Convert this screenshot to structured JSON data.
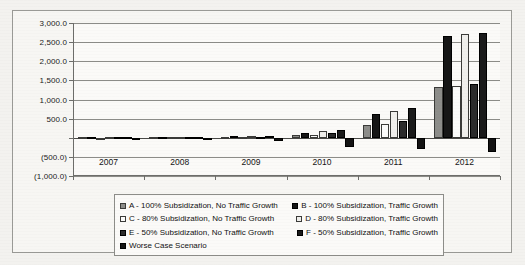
{
  "chart_data": {
    "type": "bar",
    "title": "",
    "subtitle": "",
    "xlabel": "",
    "ylabel": "",
    "grid": true,
    "legend_position": "bottom",
    "categories": [
      "2007",
      "2008",
      "2009",
      "2010",
      "2011",
      "2012"
    ],
    "ylim": [
      -1000,
      3000
    ],
    "ytick_values": [
      3000,
      2500,
      2000,
      1500,
      1000,
      500,
      0,
      -500,
      -1000
    ],
    "ytick_labels": [
      "3,000.0",
      "2,500.0",
      "2,000.0",
      "1,500.0",
      "1,000.0",
      "500.0",
      "",
      "(500.0)",
      "(1,000.0)"
    ],
    "series": [
      {
        "name": "A - 100% Subsidization, No Traffic Growth",
        "key": "A",
        "color": "#8d8d8a",
        "values": [
          8,
          12,
          30,
          70,
          330,
          1320
        ]
      },
      {
        "name": "B - 100% Subsidization, Traffic Growth",
        "key": "B",
        "color": "#161616",
        "values": [
          10,
          16,
          45,
          130,
          620,
          2650
        ]
      },
      {
        "name": "C - 80% Subsidization, No Traffic Growth",
        "key": "C",
        "color": "#fbfbfa",
        "values": [
          6,
          10,
          25,
          60,
          350,
          1340
        ]
      },
      {
        "name": "D - 80% Subsidization, Traffic Growth",
        "key": "D",
        "color": "#f0efec",
        "values": [
          9,
          14,
          40,
          170,
          700,
          2700
        ]
      },
      {
        "name": "E - 50% Subsidization, No Traffic Growth",
        "key": "E",
        "color": "#2b2b2b",
        "values": [
          7,
          11,
          28,
          120,
          450,
          1410
        ]
      },
      {
        "name": "F - 50% Subsidization, Traffic Growth",
        "key": "F",
        "color": "#1a1a1a",
        "values": [
          10,
          18,
          50,
          215,
          770,
          2740
        ]
      },
      {
        "name": "Worse Case Scenario",
        "key": "W",
        "color": "#141414",
        "values": [
          -12,
          -20,
          -80,
          -230,
          -290,
          -360
        ]
      }
    ]
  },
  "legend": {
    "rows": [
      [
        {
          "key": "A",
          "label": "A - 100% Subsidization, No Traffic Growth"
        },
        {
          "key": "B",
          "label": "B - 100% Subsidization, Traffic Growth"
        }
      ],
      [
        {
          "key": "C",
          "label": "C - 80% Subsidization, No Traffic Growth"
        },
        {
          "key": "D",
          "label": "D - 80% Subsidization, Traffic Growth"
        }
      ],
      [
        {
          "key": "E",
          "label": "E - 50% Subsidization, No Traffic Growth"
        },
        {
          "key": "F",
          "label": "F - 50% Subsidization, Traffic Growth"
        }
      ],
      [
        {
          "key": "W",
          "label": "Worse Case Scenario"
        }
      ]
    ]
  }
}
